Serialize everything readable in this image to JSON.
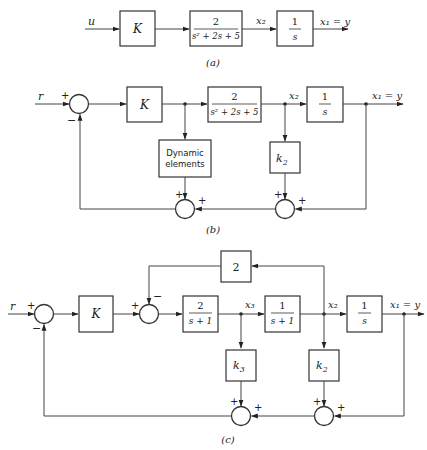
{
  "figure": {
    "captions": [
      "(a)",
      "(b)",
      "(c)"
    ]
  },
  "diagram_a": {
    "input": "u",
    "blocks": [
      {
        "id": "K",
        "label": "K"
      },
      {
        "id": "plant",
        "num": "2",
        "den": "s² + 2s + 5"
      },
      {
        "id": "integrator",
        "num": "1",
        "den": "s"
      }
    ],
    "signals": {
      "mid": "x₂",
      "output": "x₁ = y"
    },
    "caption": "(a)"
  },
  "diagram_b": {
    "input": "r",
    "blocks": [
      {
        "id": "K",
        "label": "K"
      },
      {
        "id": "plant",
        "num": "2",
        "den": "s² + 2s + 5"
      },
      {
        "id": "integrator",
        "num": "1",
        "den": "s"
      },
      {
        "id": "dynamic",
        "line1": "Dynamic",
        "line2": "elements"
      },
      {
        "id": "k2",
        "label": "k",
        "sub": "2"
      }
    ],
    "signals": {
      "mid": "x₂",
      "output": "x₁ = y"
    },
    "signs": {
      "input_plus": "+",
      "feedback_minus": "−",
      "plus": "+"
    },
    "caption": "(b)"
  },
  "diagram_c": {
    "input": "r",
    "blocks": [
      {
        "id": "K",
        "label": "K"
      },
      {
        "id": "g1",
        "num": "2",
        "den": "s + 1"
      },
      {
        "id": "g2",
        "num": "1",
        "den": "s + 1"
      },
      {
        "id": "integrator",
        "num": "1",
        "den": "s"
      },
      {
        "id": "gain2",
        "label": "2"
      },
      {
        "id": "k3",
        "label": "k",
        "sub": "3"
      },
      {
        "id": "k2",
        "label": "k",
        "sub": "2"
      }
    ],
    "signals": {
      "x3": "x₃",
      "x2": "x₂",
      "output": "x₁ = y"
    },
    "signs": {
      "plus": "+",
      "minus": "−"
    },
    "caption": "(c)"
  }
}
